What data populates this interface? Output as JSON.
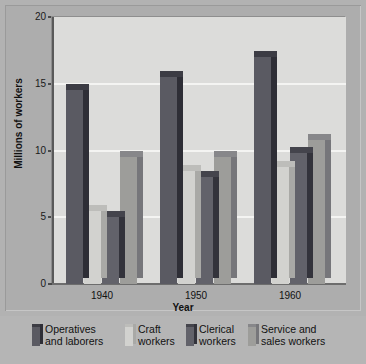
{
  "chart_data": {
    "type": "bar",
    "title": "",
    "xlabel": "Year",
    "ylabel": "Millions of workers",
    "categories": [
      "1940",
      "1950",
      "1960"
    ],
    "ylim": [
      0,
      20
    ],
    "yticks": [
      0,
      5,
      10,
      15,
      20
    ],
    "ytick_labels": [
      "0",
      "5",
      "10",
      "15",
      "20"
    ],
    "grid": true,
    "legend_position": "bottom",
    "series": [
      {
        "name": "Operatives and laborers",
        "color": "#5a5a62",
        "values": [
          14.5,
          15.5,
          17.0
        ]
      },
      {
        "name": "Craft workers",
        "color": "#d2d2cf",
        "values": [
          5.5,
          8.5,
          8.8
        ]
      },
      {
        "name": "Clerical workers",
        "color": "#62626a",
        "values": [
          5.0,
          8.0,
          9.8
        ]
      },
      {
        "name": "Service and sales workers",
        "color": "#9d9d9a",
        "values": [
          9.5,
          9.5,
          10.8
        ]
      }
    ]
  },
  "axes": {
    "y_label": "Millions of workers",
    "x_label": "Year",
    "y_tick_labels": [
      "20",
      "15",
      "10",
      "5",
      "0"
    ],
    "x_tick_labels": [
      "1940",
      "1950",
      "1960"
    ]
  },
  "legend": {
    "items": [
      {
        "line1": "Operatives",
        "line2": "and laborers",
        "swatch": "legend-swatch-operatives"
      },
      {
        "line1": "Craft",
        "line2": "workers",
        "swatch": "legend-swatch-craft"
      },
      {
        "line1": "Clerical",
        "line2": "workers",
        "swatch": "legend-swatch-clerical"
      },
      {
        "line1": "Service and",
        "line2": "sales workers",
        "swatch": "legend-swatch-service"
      }
    ]
  },
  "colors": {
    "operatives": "#5a5a62",
    "operatives_top": "#3c3c44",
    "operatives_side": "#2e2e36",
    "craft": "#d2d2cf",
    "craft_top": "#bdbdba",
    "craft_side": "#a9a9a6",
    "clerical": "#62626a",
    "clerical_top": "#44444c",
    "clerical_side": "#33333b",
    "service": "#9d9d9a",
    "service_top": "#87878a",
    "service_side": "#76767a",
    "plot_background": "#dcdcda",
    "gridline": "#f4f4f2",
    "page_background": "#b2b2b2"
  }
}
